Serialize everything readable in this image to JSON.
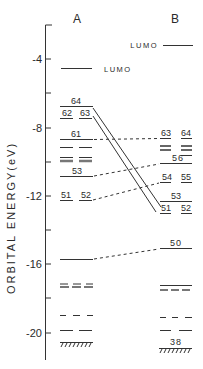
{
  "columns": {
    "a": "A",
    "b": "B"
  },
  "axis": {
    "label": "ORBITAL ENERGY(eV)",
    "ticks": [
      {
        "value": -4,
        "label": "-4",
        "y": 59
      },
      {
        "value": -6,
        "label": "",
        "y": 93
      },
      {
        "value": -8,
        "label": "-8",
        "y": 128
      },
      {
        "value": -10,
        "label": "",
        "y": 162
      },
      {
        "value": -12,
        "label": "-12",
        "y": 196
      },
      {
        "value": -14,
        "label": "",
        "y": 230
      },
      {
        "value": -16,
        "label": "-16",
        "y": 264
      },
      {
        "value": -18,
        "label": "",
        "y": 298
      },
      {
        "value": -20,
        "label": "-20",
        "y": 333
      }
    ]
  },
  "labels": {
    "a_lumo": "LUMO",
    "b_lumo": "LUMO",
    "a_64": "64",
    "a_62": "62",
    "a_63": "63",
    "a_61": "61",
    "a_53": "53",
    "a_51": "51",
    "a_52": "52",
    "b_63": "63",
    "b_64": "64",
    "b_56": "56",
    "b_54": "54",
    "b_55": "55",
    "b_53": "53",
    "b_51": "51",
    "b_52": "52",
    "b_50": "50",
    "b_38": "38"
  }
}
